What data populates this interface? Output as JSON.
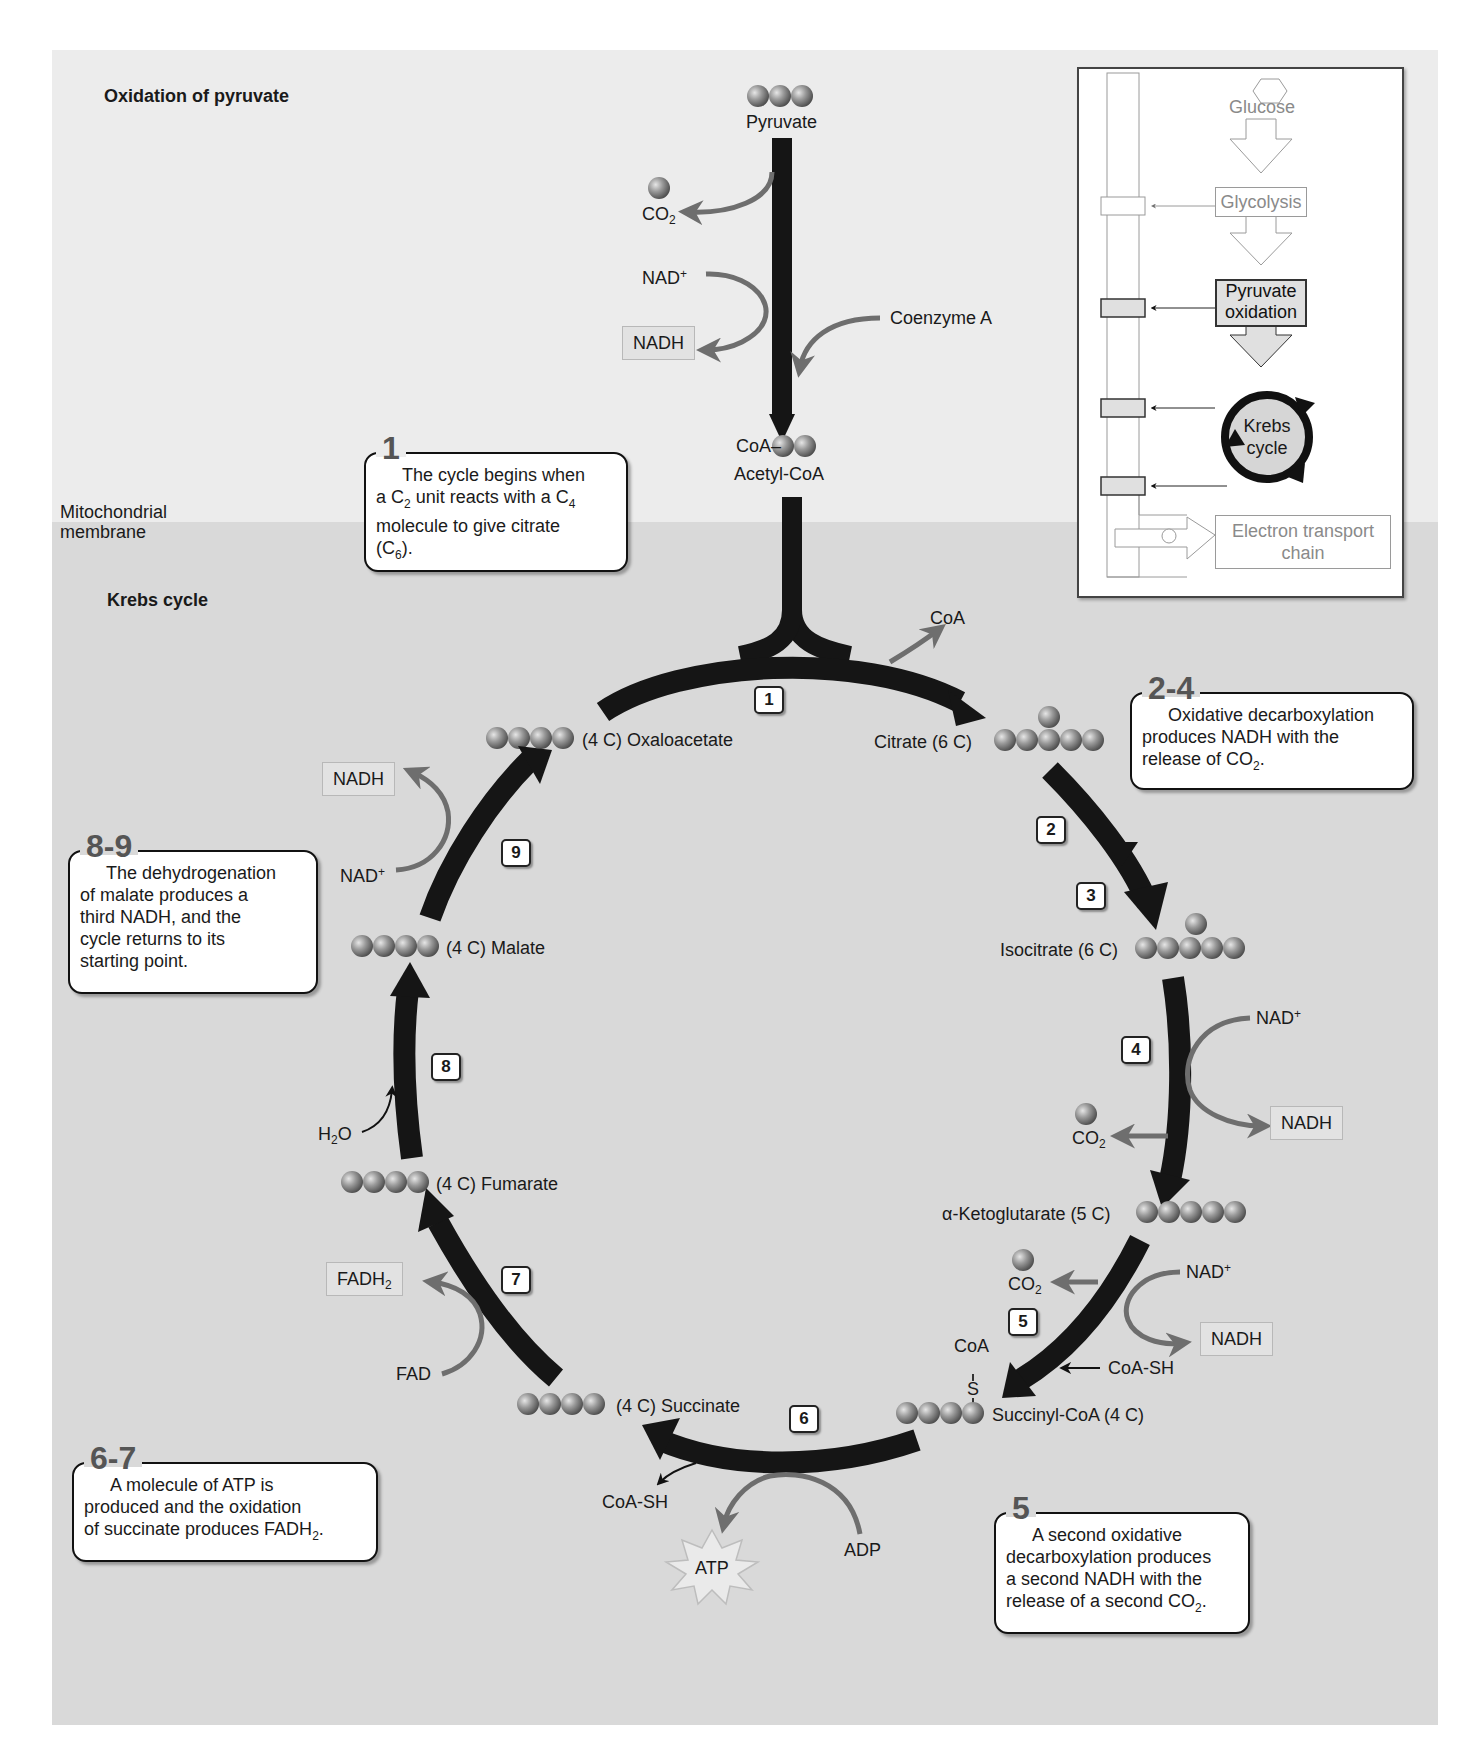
{
  "sections": {
    "top_title": "Oxidation of pyruvate",
    "bottom_title": "Krebs cycle",
    "membrane_label_line1": "Mitochondrial",
    "membrane_label_line2": "membrane"
  },
  "pyruvate_oxidation": {
    "pyruvate": "Pyruvate",
    "co2": "CO",
    "co2_sub": "2",
    "nad_plus": "NAD",
    "nad_plus_sup": "+",
    "nadh": "NADH",
    "coenzyme_a": "Coenzyme A",
    "acetyl_coa_prefix": "CoA–",
    "acetyl_coa": "Acetyl-CoA"
  },
  "cycle": {
    "coa_release": "CoA",
    "compounds": {
      "oxaloacetate": "(4 C) Oxaloacetate",
      "citrate": "Citrate (6 C)",
      "isocitrate": "Isocitrate (6 C)",
      "ketoglutarate": "α-Ketoglutarate (5 C)",
      "succinyl_coa": "Succinyl-CoA (4 C)",
      "succinate": "(4 C) Succinate",
      "fumarate": "(4 C) Fumarate",
      "malate": "(4 C) Malate"
    },
    "steps": [
      "1",
      "2",
      "3",
      "4",
      "5",
      "6",
      "7",
      "8",
      "9"
    ],
    "cofactors": {
      "step4_nad": "NAD",
      "step4_nadh": "NADH",
      "step4_co2": "CO",
      "step5_nad": "NAD",
      "step5_nadh": "NADH",
      "step5_co2": "CO",
      "step5_coash": "CoA-SH",
      "succinyl_coa_group": "CoA",
      "succinyl_s": "S",
      "step6_coash": "CoA-SH",
      "step6_adp": "ADP",
      "step6_atp": "ATP",
      "step7_fad": "FAD",
      "step7_fadh2": "FADH",
      "step8_h2o_h": "H",
      "step8_h2o_o": "O",
      "step9_nad": "NAD",
      "step9_nadh": "NADH",
      "plus": "+",
      "sub2": "2"
    }
  },
  "callouts": {
    "c1": {
      "number": "1",
      "line1": "The cycle begins when",
      "line2_a": "a C",
      "line2_sub1": "2",
      "line2_b": " unit reacts with a C",
      "line2_sub2": "4",
      "line3": "molecule to give citrate",
      "line4_a": "(C",
      "line4_sub": "6",
      "line4_b": ")."
    },
    "c24": {
      "number": "2-4",
      "line1": "Oxidative decarboxylation",
      "line2": "produces NADH with the",
      "line3_a": "release of CO",
      "line3_sub": "2",
      "line3_b": "."
    },
    "c89": {
      "number": "8-9",
      "line1": "The dehydrogenation",
      "line2": "of malate produces a",
      "line3": "third NADH, and the",
      "line4": "cycle returns to its",
      "line5": "starting point."
    },
    "c67": {
      "number": "6-7",
      "line1": "A molecule of ATP is",
      "line2": "produced and the oxidation",
      "line3_a": "of succinate produces FADH",
      "line3_sub": "2",
      "line3_b": "."
    },
    "c5": {
      "number": "5",
      "line1": "A second oxidative",
      "line2": "decarboxylation produces",
      "line3": "a second NADH with the",
      "line4_a": "release of a second CO",
      "line4_sub": "2",
      "line4_b": "."
    }
  },
  "inset": {
    "glucose": "Glucose",
    "glycolysis": "Glycolysis",
    "pyruvate_oxidation_line1": "Pyruvate",
    "pyruvate_oxidation_line2": "oxidation",
    "krebs_line1": "Krebs",
    "krebs_line2": "cycle",
    "etc_line1": "Electron transport",
    "etc_line2": "chain"
  },
  "colors": {
    "arrow_main": "#151515",
    "arrow_side": "#6e6e6e",
    "sphere": "#8a8a8a",
    "panel_top": "#ececec",
    "panel_bottom": "#d9d9d9"
  }
}
